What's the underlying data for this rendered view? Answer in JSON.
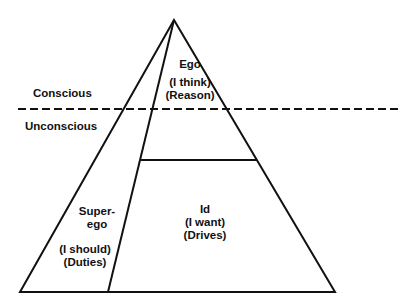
{
  "diagram": {
    "levels": {
      "conscious": "Conscious",
      "unconscious": "Unconscious"
    },
    "regions": {
      "ego": {
        "name": "Ego",
        "phrase": "(I think)",
        "basis": "(Reason)"
      },
      "superego": {
        "name_line1": "Super-",
        "name_line2": "ego",
        "phrase": "(I should)",
        "basis": "(Duties)"
      },
      "id": {
        "name": "Id",
        "phrase": "(I want)",
        "basis": "(Drives)"
      }
    },
    "colors": {
      "line": "#111111",
      "background": "#ffffff"
    }
  }
}
